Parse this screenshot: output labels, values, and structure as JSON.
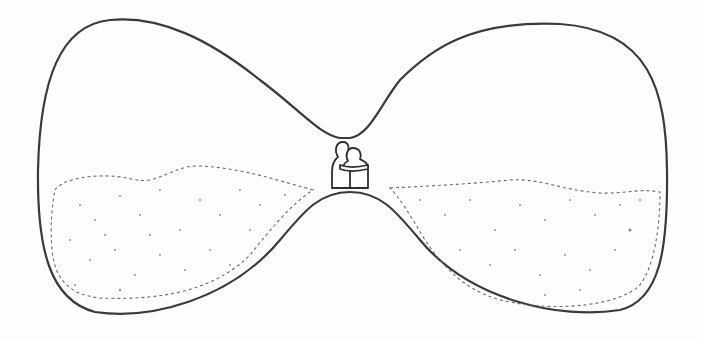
{
  "illustration": {
    "subject": "Sideways hourglass sketch with two embracing figures at the neck",
    "style": "pencil line drawing",
    "colors": {
      "background": "#fdfdfd",
      "outline": "#3a3a3a",
      "sand_dots": "#8a8a8a"
    },
    "elements": [
      {
        "name": "hourglass-left-bulb",
        "sand_fill": "partial, lower half"
      },
      {
        "name": "hourglass-right-bulb",
        "sand_fill": "partial, lower half"
      },
      {
        "name": "embracing-figures",
        "count": 2,
        "position": "hourglass neck"
      }
    ]
  }
}
